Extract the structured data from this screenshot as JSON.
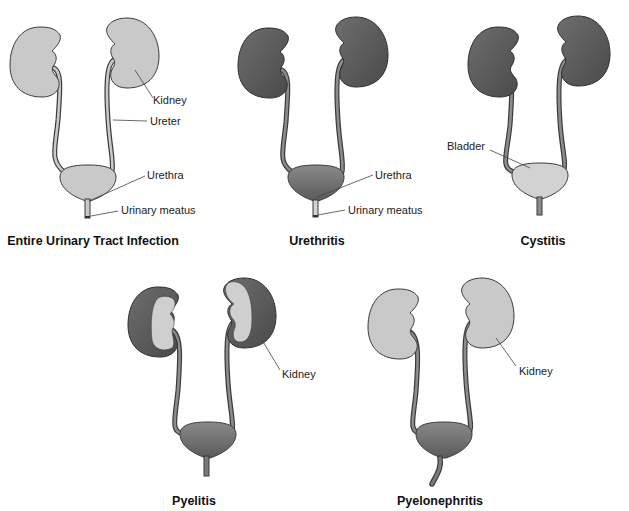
{
  "figure": {
    "colors": {
      "healthy_fill": "#c9c9c9",
      "infected_fill": "#5f5f5f",
      "outline": "#3a3a3a",
      "background": "#ffffff"
    },
    "panels": [
      {
        "id": "entire",
        "title": "Entire Urinary Tract Infection",
        "labels": {
          "kidney": "Kidney",
          "ureter": "Ureter",
          "urethra": "Urethra",
          "meatus": "Urinary meatus"
        }
      },
      {
        "id": "urethritis",
        "title": "Urethritis",
        "labels": {
          "urethra": "Urethra",
          "meatus": "Urinary meatus"
        }
      },
      {
        "id": "cystitis",
        "title": "Cystitis",
        "labels": {
          "bladder": "Bladder"
        }
      },
      {
        "id": "pyelitis",
        "title": "Pyelitis",
        "labels": {
          "kidney": "Kidney"
        }
      },
      {
        "id": "pyelonephritis",
        "title": "Pyelonephritis",
        "labels": {
          "kidney": "Kidney"
        }
      }
    ]
  }
}
